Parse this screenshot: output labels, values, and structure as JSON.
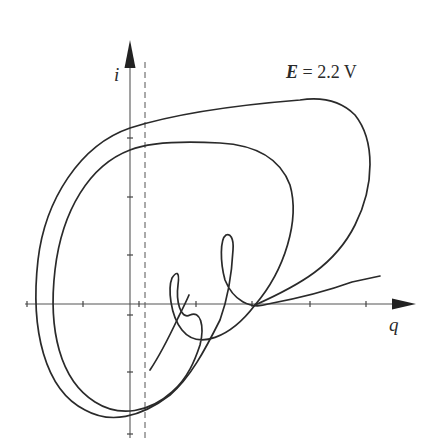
{
  "figure": {
    "type": "phase-portrait",
    "axes": {
      "x_label": "q",
      "y_label": "i"
    },
    "parameter": {
      "symbol": "E",
      "equals": "=",
      "value": "2.2",
      "unit": "V"
    },
    "dashed_line": "vertical dashed reference line just right of the i-axis",
    "curves": [
      {
        "name": "outer-trajectory",
        "description": "outer closed loop of the attractor"
      },
      {
        "name": "inner-trajectory",
        "description": "inner closed loop with two small loops near the q-axis"
      }
    ],
    "colors": {
      "line": "#2a2a2a",
      "axis": "#555555",
      "background": "#ffffff"
    }
  }
}
